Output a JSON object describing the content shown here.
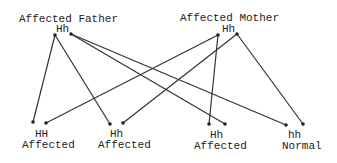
{
  "parents": [
    {
      "id": "father",
      "title": "Affected Father",
      "genotype": "Hh",
      "dots": [
        [
          55,
          35
        ],
        [
          71,
          34
        ]
      ]
    },
    {
      "id": "mother",
      "title": "Affected Mother",
      "genotype": "Hh",
      "dots": [
        [
          218,
          35
        ],
        [
          237,
          34
        ]
      ]
    }
  ],
  "children": [
    {
      "genotype": "HH",
      "phenotype": "Affected",
      "dots": [
        [
          33,
          122
        ],
        [
          46,
          123
        ]
      ]
    },
    {
      "genotype": "Hh",
      "phenotype": "Affected",
      "dots": [
        [
          110,
          124
        ],
        [
          123,
          123
        ]
      ]
    },
    {
      "genotype": "Hh",
      "phenotype": "Affected",
      "dots": [
        [
          209,
          124
        ],
        [
          225,
          124
        ]
      ]
    },
    {
      "genotype": "hh",
      "phenotype": "Normal",
      "dots": [
        [
          286,
          125
        ],
        [
          303,
          124
        ]
      ]
    }
  ],
  "lines": [
    {
      "from": [
        55,
        35
      ],
      "to": [
        33,
        122
      ]
    },
    {
      "from": [
        55,
        35
      ],
      "to": [
        110,
        124
      ]
    },
    {
      "from": [
        71,
        34
      ],
      "to": [
        225,
        124
      ]
    },
    {
      "from": [
        71,
        34
      ],
      "to": [
        286,
        125
      ]
    },
    {
      "from": [
        218,
        35
      ],
      "to": [
        46,
        123
      ]
    },
    {
      "from": [
        218,
        35
      ],
      "to": [
        209,
        124
      ]
    },
    {
      "from": [
        237,
        34
      ],
      "to": [
        123,
        123
      ]
    },
    {
      "from": [
        237,
        34
      ],
      "to": [
        303,
        124
      ]
    }
  ],
  "colors": {
    "line": "#333333",
    "text": "#222222",
    "background": "#ffffff"
  }
}
